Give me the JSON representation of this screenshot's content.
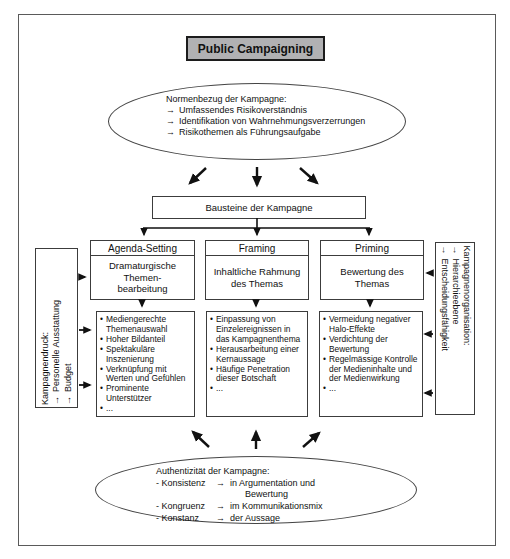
{
  "title": "Public Campaigning",
  "glyphs": {
    "arrow": "→",
    "bullet": "•"
  },
  "colors": {
    "title_bg": "#b1b1b3",
    "line": "#111111",
    "border": "#3c3c3c"
  },
  "top_ellipse": {
    "heading": "Normenbezug der Kampagne:",
    "items": [
      "Umfassendes Risikoverständnis",
      "Identifikation von Wahrnehmungsverzerrungen",
      "Risikothemen als Führungsaufgabe"
    ]
  },
  "bausteine_label": "Bausteine der Kampagne",
  "columns": [
    {
      "header": "Agenda-Setting",
      "subtitle": "Dramaturgische\nThemen-\nbearbeitung",
      "bullets": [
        "Mediengerechte Themenauswahl",
        "Hoher Bildanteil",
        "Spektakuläre Inszenierung",
        "Verknüpfung mit Werten und Gefühlen",
        "Prominente Unterstützer",
        "..."
      ]
    },
    {
      "header": "Framing",
      "subtitle": "Inhaltliche Rahmung\ndes Themas",
      "bullets": [
        "Einpassung von Einzelereignissen in das Kampagnenthema",
        "Herausarbeitung einer Kernaussage",
        "Häufige Penetration dieser Botschaft",
        "..."
      ]
    },
    {
      "header": "Priming",
      "subtitle": "Bewertung des\nThemas",
      "bullets": [
        "Vermeidung negativer Halo-Effekte",
        "Verdichtung der Bewertung",
        "Regelmässige Kontrolle der Medieninhalte und der Medienwirkung",
        "..."
      ]
    }
  ],
  "left_box": {
    "heading": "Kampagnendruck:",
    "items": [
      "Personelle Ausstattung",
      "Budget"
    ]
  },
  "right_box": {
    "heading": "Kampagnenorganisation:",
    "items": [
      "Hierarchieebene",
      "Entscheidungsfähigkeit"
    ]
  },
  "bottom_ellipse": {
    "heading": "Authentizität der Kampagne:",
    "rows": [
      {
        "term": "- Konsistenz",
        "desc": "in Argumentation und\n      Bewertung"
      },
      {
        "term": "- Kongruenz",
        "desc": "im Kommunikationsmix"
      },
      {
        "term": "- Konstanz",
        "desc": "der Aussage"
      }
    ]
  }
}
